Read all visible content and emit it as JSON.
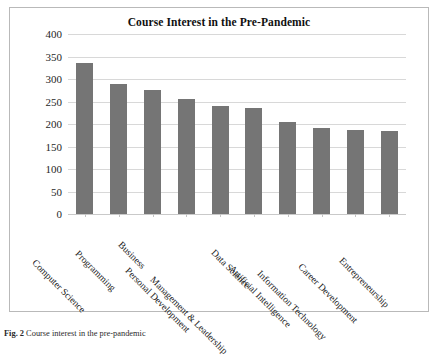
{
  "figure": {
    "caption_label": "Fig. 2",
    "caption_text": "Course interest in the pre-pandemic"
  },
  "colors": {
    "bar": "#757575",
    "gridline": "#d8d8d8",
    "frame_border": "#b9b9b9",
    "text": "#1a1a1a",
    "background": "#ffffff"
  },
  "chart_data": {
    "type": "bar",
    "title": "Course Interest in the Pre-Pandemic",
    "xlabel": "",
    "ylabel": "",
    "ylim": [
      0,
      400
    ],
    "ytick_step": 50,
    "ytick_labels": [
      "400",
      "350",
      "300",
      "250",
      "200",
      "150",
      "100",
      "50",
      "0"
    ],
    "ytick_values": [
      400,
      350,
      300,
      250,
      200,
      150,
      100,
      50,
      0
    ],
    "grid": true,
    "legend": false,
    "legend_position": "none",
    "categories": [
      "Computer Science",
      "Programming",
      "Business",
      "Personal Development",
      "Management & Leadership",
      "Data Science",
      "Artificial Intelligence",
      "Information Technology",
      "Career Development",
      "Entrepreneurship"
    ],
    "values": [
      335,
      290,
      275,
      256,
      240,
      235,
      205,
      191,
      187,
      185
    ],
    "series": [
      {
        "name": "Course Interest",
        "values": [
          335,
          290,
          275,
          256,
          240,
          235,
          205,
          191,
          187,
          185
        ]
      }
    ]
  }
}
